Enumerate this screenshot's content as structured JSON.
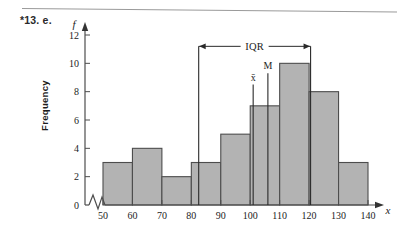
{
  "page": {
    "exercise_label": "*13. e.",
    "background_color": "#ffffff",
    "rule_color": "#9a9a9a"
  },
  "chart_data": {
    "type": "bar",
    "title": "",
    "subtitle": "",
    "xlabel": "x",
    "ylabel": "Frequency",
    "y_axis_symbol": "f",
    "x_axis_symbol": "x",
    "categories": [
      "50-60",
      "60-70",
      "70-80",
      "80-90",
      "90-100",
      "100-110",
      "110-120",
      "120-130",
      "130-140"
    ],
    "bin_edges": [
      50,
      60,
      70,
      80,
      90,
      100,
      110,
      120,
      130,
      140
    ],
    "values": [
      3,
      4,
      2,
      3,
      5,
      7,
      10,
      8,
      3
    ],
    "xlim": [
      50,
      140
    ],
    "ylim": [
      0,
      12
    ],
    "xticks": [
      "50",
      "60",
      "70",
      "80",
      "90",
      "100",
      "110",
      "120",
      "130",
      "140"
    ],
    "xtick_values": [
      50,
      60,
      70,
      80,
      90,
      100,
      110,
      120,
      130,
      140
    ],
    "yticks": [
      "0",
      "2",
      "4",
      "6",
      "8",
      "10",
      "12"
    ],
    "ytick_values": [
      0,
      2,
      4,
      6,
      8,
      10,
      12
    ],
    "grid": false,
    "legend": "none",
    "bar_fill_color": "#b3b3b3",
    "bar_stroke_color": "#4d4d4d",
    "axis_color": "#4d4d4d",
    "axis_break": true,
    "annotations": [
      {
        "name": "iqr",
        "label": "IQR",
        "from": 82.5,
        "to": 120.5,
        "y_value": 11.2,
        "style": "double-arrow"
      },
      {
        "name": "mean",
        "label": "x̄",
        "x_value": 101.0,
        "top_y_value": 8.5,
        "bottom_y_value": 0
      },
      {
        "name": "median",
        "label": "M",
        "x_value": 106.0,
        "top_y_value": 9.3,
        "bottom_y_value": 0
      }
    ]
  }
}
